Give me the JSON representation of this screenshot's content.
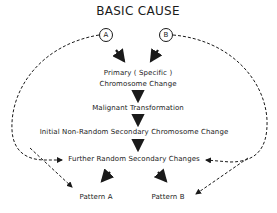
{
  "diagram": {
    "title": "BASIC CAUSE",
    "branches": [
      {
        "id": "A",
        "label": "A"
      },
      {
        "id": "B",
        "label": "B"
      }
    ],
    "nodes": {
      "primary_line1": "Primary ( Specific )",
      "primary_line2": "Chromosome Change",
      "malignant": "Malignant  Transformation",
      "initial": "Initial  Non-Random  Secondary  Chromosome Change",
      "further": "Further  Random  Secondary  Changes",
      "pattern_a": "Pattern  A",
      "pattern_b": "Pattern  B"
    },
    "edges": [
      {
        "from": "A",
        "to": "primary",
        "style": "solid-bold"
      },
      {
        "from": "B",
        "to": "primary",
        "style": "solid-bold"
      },
      {
        "from": "primary",
        "to": "malignant",
        "style": "solid-bold"
      },
      {
        "from": "malignant",
        "to": "initial",
        "style": "solid-bold"
      },
      {
        "from": "initial",
        "to": "further",
        "style": "solid-bold"
      },
      {
        "from": "further",
        "to": "pattern_a",
        "style": "solid-bold"
      },
      {
        "from": "further",
        "to": "pattern_b",
        "style": "solid-bold"
      },
      {
        "from": "A",
        "to": "further",
        "style": "dashed"
      },
      {
        "from": "A",
        "to": "pattern_a",
        "style": "dashed"
      },
      {
        "from": "B",
        "to": "further",
        "style": "dashed"
      },
      {
        "from": "B",
        "to": "pattern_b",
        "style": "dashed"
      }
    ]
  }
}
